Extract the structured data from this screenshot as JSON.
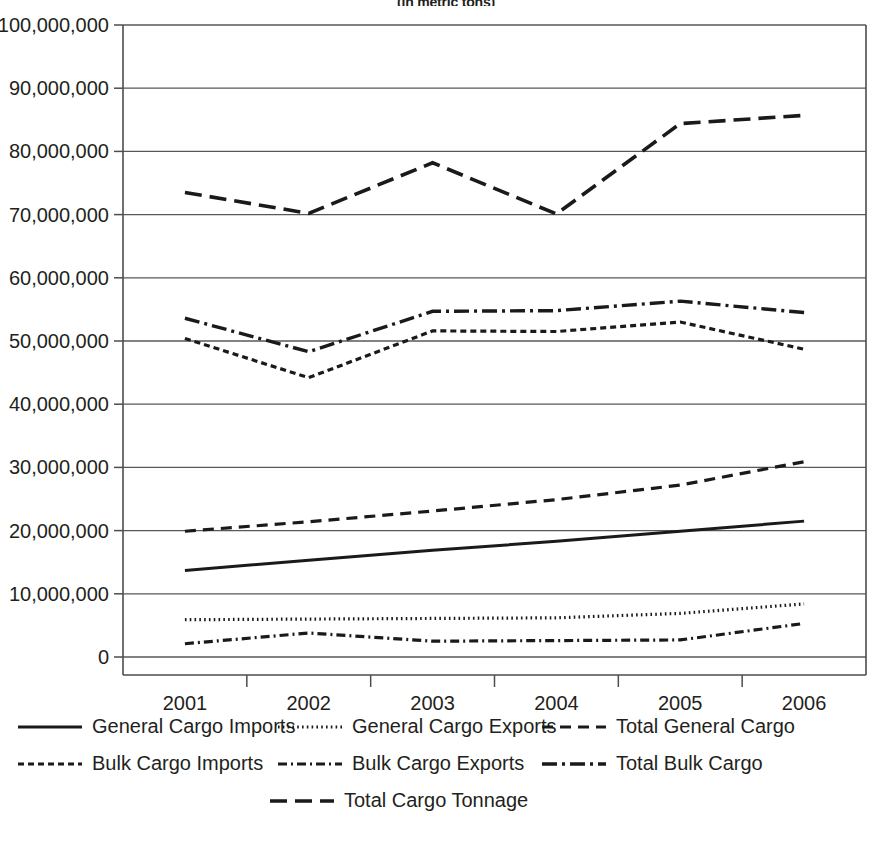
{
  "chart_data": {
    "type": "line",
    "title": "(in metric tons)",
    "xlabel": "",
    "ylabel": "",
    "categories": [
      "2001",
      "2002",
      "2003",
      "2004",
      "2005",
      "2006"
    ],
    "x": [
      2001,
      2002,
      2003,
      2004,
      2005,
      2006
    ],
    "ylim": [
      0,
      100000000
    ],
    "ytick_values": [
      0,
      10000000,
      20000000,
      30000000,
      40000000,
      50000000,
      60000000,
      70000000,
      80000000,
      90000000,
      100000000
    ],
    "ytick_labels": [
      "0",
      "10,000,000",
      "20,000,000",
      "30,000,000",
      "40,000,000",
      "50,000,000",
      "60,000,000",
      "70,000,000",
      "80,000,000",
      "90,000,000",
      "100,000,000"
    ],
    "grid": true,
    "grid_axis": "y",
    "legend_position": "bottom",
    "series": [
      {
        "name": "General Cargo Imports",
        "style": "solid",
        "dash": "none",
        "width": 3.0,
        "values": [
          13700000,
          15300000,
          16900000,
          18300000,
          19900000,
          21500000
        ]
      },
      {
        "name": "General Cargo Exports",
        "style": "dotted",
        "dash": "1.6 3.2",
        "width": 3.2,
        "values": [
          5900000,
          6000000,
          6100000,
          6200000,
          6900000,
          8400000
        ]
      },
      {
        "name": "Total General Cargo",
        "style": "dashed",
        "dash": "11 7",
        "width": 3.2,
        "values": [
          19900000,
          21400000,
          23100000,
          24900000,
          27200000,
          30900000
        ]
      },
      {
        "name": "Bulk Cargo Imports",
        "style": "short-dashed",
        "dash": "6 4",
        "width": 3.2,
        "values": [
          50400000,
          44200000,
          51600000,
          51500000,
          53000000,
          48700000
        ]
      },
      {
        "name": "Bulk Cargo Exports",
        "style": "dash-dot",
        "dash": "9 4 2 4",
        "width": 3.2,
        "values": [
          2100000,
          3800000,
          2500000,
          2600000,
          2700000,
          5300000
        ]
      },
      {
        "name": "Total Bulk Cargo",
        "style": "long-dash-dot",
        "dash": "15 5 3 5",
        "width": 3.4,
        "values": [
          53600000,
          48300000,
          54700000,
          54800000,
          56300000,
          54500000
        ]
      },
      {
        "name": "Total Cargo Tonnage",
        "style": "long-dashed",
        "dash": "17 8",
        "width": 3.6,
        "values": [
          73500000,
          70200000,
          78200000,
          70100000,
          84400000,
          85700000
        ]
      }
    ],
    "legend_rows": [
      [
        {
          "label": "General Cargo Imports",
          "series_index": 0
        },
        {
          "label": "General Cargo Exports",
          "series_index": 1
        },
        {
          "label": "Total General Cargo",
          "series_index": 2
        }
      ],
      [
        {
          "label": "Bulk Cargo Imports",
          "series_index": 3
        },
        {
          "label": "Bulk Cargo Exports",
          "series_index": 4
        },
        {
          "label": "Total Bulk Cargo",
          "series_index": 5
        }
      ],
      [
        {
          "label": "Total Cargo Tonnage",
          "series_index": 6
        }
      ]
    ],
    "colors": {
      "line": "#1a1a1a",
      "grid": "#58595b",
      "axis": "#4d4d4d",
      "text": "#231f20",
      "background": "#ffffff"
    }
  }
}
